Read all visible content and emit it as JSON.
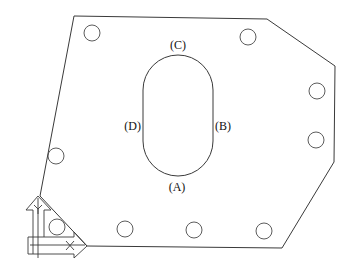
{
  "diagram": {
    "type": "plate-with-slot-and-holes",
    "outline_points": [
      [
        74,
        16
      ],
      [
        267,
        19
      ],
      [
        335,
        66
      ],
      [
        334,
        162
      ],
      [
        282,
        248
      ],
      [
        87,
        246
      ],
      [
        40,
        196
      ]
    ],
    "slot": {
      "x_left": 143,
      "x_right": 213,
      "y_top": 55,
      "y_bottom": 176,
      "radius": 35
    },
    "hole_radius": 8,
    "holes": [
      {
        "cx": 92,
        "cy": 33
      },
      {
        "cx": 248,
        "cy": 37
      },
      {
        "cx": 317,
        "cy": 91
      },
      {
        "cx": 316,
        "cy": 140
      },
      {
        "cx": 56,
        "cy": 156
      },
      {
        "cx": 57,
        "cy": 227
      },
      {
        "cx": 125,
        "cy": 229
      },
      {
        "cx": 194,
        "cy": 230
      },
      {
        "cx": 264,
        "cy": 231
      }
    ],
    "labels": {
      "a": "(A)",
      "b": "(B)",
      "c": "(C)",
      "d": "(D)"
    },
    "axes": {
      "x_label_glyph": "X",
      "y_label_glyph": "Y"
    }
  }
}
